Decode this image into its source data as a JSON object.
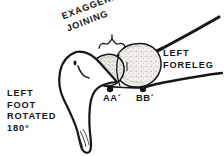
{
  "figure": {
    "background_color": "#fefefe",
    "ink_color": "#15161a",
    "stipple_color": "#5e5e5e",
    "stipple_fill": "#efece6"
  },
  "labels": {
    "exaggerated_joining": "EXAGGERATED\nJOINING",
    "left_foreleg": "LEFT\nFORELEG",
    "left_foot_rotated": "LEFT\nFOOT\nROTATED\n180°",
    "point_aa": "AA´",
    "point_bb": "BB´"
  },
  "markers": [
    {
      "name": "junction-point-aa",
      "label": "AA´",
      "x": 110,
      "y": 89
    },
    {
      "name": "junction-point-bb",
      "label": "BB´",
      "x": 143,
      "y": 89
    }
  ],
  "parts": [
    {
      "name": "left-foot-outline",
      "description": "wedge-shaped rotated foot at left"
    },
    {
      "name": "proximal-bone-end",
      "description": "smaller stippled rounded bone end near AA´"
    },
    {
      "name": "distal-bone-end",
      "description": "larger stippled rounded bone end near BB´"
    },
    {
      "name": "foreleg-shaft",
      "description": "tapering limb extending to upper and lower right"
    },
    {
      "name": "joining-brace",
      "description": "curly brace indicating the joining region"
    }
  ]
}
